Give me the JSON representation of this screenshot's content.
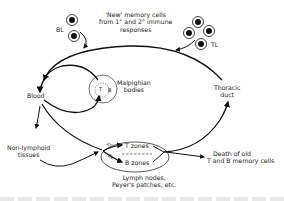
{
  "diagram": {
    "type": "lymphocyte-recirculation-cycle",
    "labels": {
      "new_memory_line1": "'New' memory cells",
      "new_memory_line2": "from 1° and 2° immune",
      "new_memory_line3": "responses",
      "bl": "BL",
      "tl": "TL",
      "blood": "Blood",
      "malpighian_line1": "Malpighian",
      "malpighian_line2": "bodies",
      "malpighian_t": "T",
      "malpighian_b": "B",
      "thoracic_line1": "Thoracic",
      "thoracic_line2": "duct",
      "non_lymphoid_line1": "Non-lymphoid",
      "non_lymphoid_line2": "tissues",
      "t_zones": "T zones",
      "b_zones": "B zones",
      "tl_small": "TL",
      "bl_small": "BL",
      "lymph_line1": "Lymph nodes,",
      "lymph_line2": "Peyer's patches, etc.",
      "death_line1": "Death of old",
      "death_line2": "T and B memory cells"
    },
    "nodes": [
      "Blood",
      "Malpighian bodies",
      "Thoracic duct",
      "Lymph nodes",
      "Non-lymphoid tissues",
      "Death of old T and B memory cells"
    ],
    "edges": [
      {
        "from": "New memory cells (BL)",
        "to": "Blood"
      },
      {
        "from": "New memory cells (TL)",
        "to": "Thoracic duct route"
      },
      {
        "from": "Thoracic duct",
        "to": "Blood"
      },
      {
        "from": "Blood",
        "to": "Malpighian bodies"
      },
      {
        "from": "Malpighian bodies",
        "to": "Blood"
      },
      {
        "from": "Blood",
        "to": "Non-lymphoid tissues"
      },
      {
        "from": "Blood",
        "to": "Lymph nodes"
      },
      {
        "from": "Non-lymphoid tissues",
        "to": "Lymph nodes"
      },
      {
        "from": "Lymph nodes",
        "to": "Thoracic duct"
      },
      {
        "from": "Lymph nodes",
        "to": "Death of old T and B memory cells"
      }
    ],
    "colors": {
      "ink": "#111111",
      "background": "#ffffff"
    }
  }
}
